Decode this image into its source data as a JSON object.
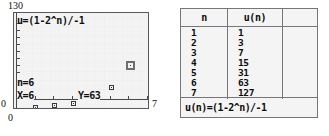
{
  "graph": {
    "formula": "u=(1-2^n)/-1",
    "y_max_label": "130",
    "y_min_label": "0",
    "x_min_label": "0",
    "x_max_label": "7",
    "trace": {
      "n_label": "n=6",
      "x_label": "X=6",
      "y_label": "Y=63"
    },
    "background_color": "#f3f3f3",
    "frame_color": "#58585a",
    "point_color": "#3a3a3c",
    "cursor_color": "#6e6e70"
  },
  "chart_data": {
    "type": "scatter",
    "title": "u=(1-2^n)/-1",
    "xlabel": "n",
    "ylabel": "u(n)",
    "xlim": [
      0,
      7
    ],
    "ylim": [
      0,
      130
    ],
    "grid": false,
    "legend": null,
    "x": [
      1,
      2,
      3,
      4,
      5,
      6,
      7
    ],
    "values": [
      1,
      3,
      7,
      15,
      31,
      63,
      127
    ],
    "annotations": [
      "n=6",
      "X=6",
      "Y=63"
    ],
    "cursor_point": {
      "n": 6,
      "u": 63
    },
    "series": [
      {
        "name": "u(n)",
        "x": [
          1,
          2,
          3,
          4,
          5,
          6,
          7
        ],
        "values": [
          1,
          3,
          7,
          15,
          31,
          63,
          127
        ]
      }
    ]
  },
  "table": {
    "headers": [
      "n",
      "u(n)"
    ],
    "rows": [
      {
        "n": "1",
        "un": "1"
      },
      {
        "n": "2",
        "un": "3"
      },
      {
        "n": "3",
        "un": "7"
      },
      {
        "n": "4",
        "un": "15"
      },
      {
        "n": "5",
        "un": "31"
      },
      {
        "n": "6",
        "un": "63"
      },
      {
        "n": "7",
        "un": "127"
      }
    ],
    "formula": "u(n)=(1-2^n)/-1"
  }
}
